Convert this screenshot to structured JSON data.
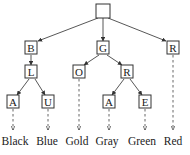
{
  "diagram": {
    "type": "trie",
    "root": {
      "id": "root",
      "label": "",
      "x": 103,
      "y": 11
    },
    "nodes": [
      {
        "id": "B",
        "label": "B",
        "x": 31,
        "y": 48
      },
      {
        "id": "G",
        "label": "G",
        "x": 103,
        "y": 48
      },
      {
        "id": "R1",
        "label": "R",
        "x": 173,
        "y": 48
      },
      {
        "id": "L",
        "label": "L",
        "x": 32,
        "y": 72
      },
      {
        "id": "O",
        "label": "O",
        "x": 79,
        "y": 72
      },
      {
        "id": "R2",
        "label": "R",
        "x": 127,
        "y": 72
      },
      {
        "id": "A1",
        "label": "A",
        "x": 13,
        "y": 102
      },
      {
        "id": "U",
        "label": "U",
        "x": 48,
        "y": 102
      },
      {
        "id": "A2",
        "label": "A",
        "x": 109,
        "y": 102
      },
      {
        "id": "E",
        "label": "E",
        "x": 145,
        "y": 102
      }
    ],
    "edges": [
      {
        "from": "root",
        "to": "B"
      },
      {
        "from": "root",
        "to": "G"
      },
      {
        "from": "root",
        "to": "R1"
      },
      {
        "from": "B",
        "to": "L"
      },
      {
        "from": "G",
        "to": "O"
      },
      {
        "from": "G",
        "to": "R2"
      },
      {
        "from": "L",
        "to": "A1"
      },
      {
        "from": "L",
        "to": "U"
      },
      {
        "from": "R2",
        "to": "A2"
      },
      {
        "from": "R2",
        "to": "E"
      }
    ],
    "leaves": [
      {
        "id": "leaf-black",
        "label": "Black",
        "parent": "A1",
        "x": 15
      },
      {
        "id": "leaf-blue",
        "label": "Blue",
        "parent": "U",
        "x": 47
      },
      {
        "id": "leaf-gold",
        "label": "Gold",
        "parent": "O",
        "x": 77
      },
      {
        "id": "leaf-gray",
        "label": "Gray",
        "parent": "A2",
        "x": 107
      },
      {
        "id": "leaf-green",
        "label": "Green",
        "parent": "E",
        "x": 142
      },
      {
        "id": "leaf-red",
        "label": "Red",
        "parent": "R1",
        "x": 173
      }
    ]
  }
}
